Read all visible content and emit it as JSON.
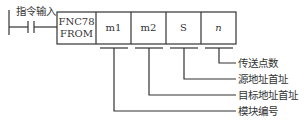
{
  "input_label": "指令输入",
  "instruction": {
    "code": "FNC78",
    "name": "FROM",
    "operands": [
      "m1",
      "m2",
      "S",
      "n"
    ]
  },
  "annotations": [
    {
      "operand": "n",
      "label": "传送点数"
    },
    {
      "operand": "S",
      "label": "源地址首址"
    },
    {
      "operand": "m2",
      "label": "目标地址首址"
    },
    {
      "operand": "m1",
      "label": "模块编号"
    }
  ]
}
